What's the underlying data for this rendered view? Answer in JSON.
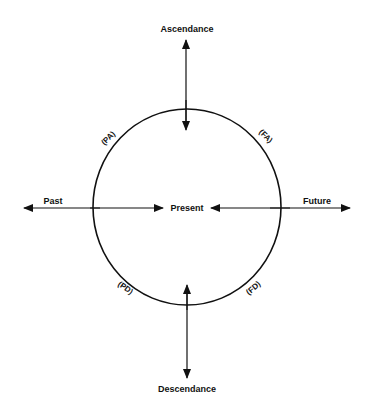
{
  "diagram": {
    "type": "circular time-direction diagram",
    "colors": {
      "line": "#111111",
      "background": "#ffffff"
    },
    "center_label": "Present",
    "axes": {
      "top": "Ascendance",
      "bottom": "Descendance",
      "left": "Past",
      "right": "Future"
    },
    "quadrant_labels": {
      "upper_left": "(PA)",
      "upper_right": "(FA)",
      "lower_left": "(PD)",
      "lower_right": "(FD)"
    }
  }
}
